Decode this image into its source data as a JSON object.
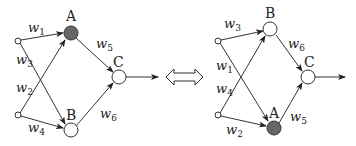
{
  "diagram": {
    "colors": {
      "line": "#333333",
      "filled_node": "#666666",
      "empty_node": "#ffffff"
    },
    "equivalence_symbol": "double-arrow",
    "left": {
      "nodes": {
        "A": {
          "label": "A",
          "filled": true
        },
        "B": {
          "label": "B",
          "filled": false
        },
        "C": {
          "label": "C",
          "filled": false
        }
      },
      "weights": {
        "w1": {
          "base": "w",
          "sub": "1"
        },
        "w2": {
          "base": "w",
          "sub": "2"
        },
        "w3": {
          "base": "w",
          "sub": "3"
        },
        "w4": {
          "base": "w",
          "sub": "4"
        },
        "w5": {
          "base": "w",
          "sub": "5"
        },
        "w6": {
          "base": "w",
          "sub": "6"
        }
      }
    },
    "right": {
      "nodes": {
        "B": {
          "label": "B",
          "filled": false
        },
        "A": {
          "label": "A",
          "filled": true
        },
        "C": {
          "label": "C",
          "filled": false
        }
      },
      "weights": {
        "w3": {
          "base": "w",
          "sub": "3"
        },
        "w1": {
          "base": "w",
          "sub": "1"
        },
        "w4": {
          "base": "w",
          "sub": "4"
        },
        "w2": {
          "base": "w",
          "sub": "2"
        },
        "w6": {
          "base": "w",
          "sub": "6"
        },
        "w5": {
          "base": "w",
          "sub": "5"
        }
      }
    }
  }
}
